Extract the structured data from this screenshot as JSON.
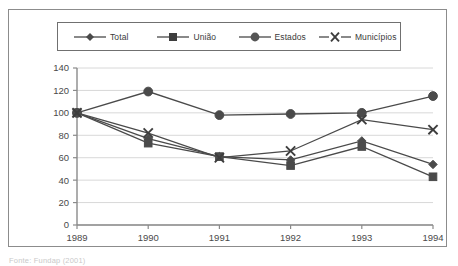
{
  "figure": {
    "caption": "Fonte: Fundap (2001)"
  },
  "legend": {
    "position": "top",
    "items": [
      {
        "label": "Total",
        "marker": "diamond-marker"
      },
      {
        "label": "União",
        "marker": "square-marker"
      },
      {
        "label": "Estados",
        "marker": "circle-marker"
      },
      {
        "label": "Municípios",
        "marker": "x-marker"
      }
    ]
  },
  "chart_data": {
    "type": "line",
    "title": "",
    "subtitle": "",
    "xlabel": "",
    "ylabel": "",
    "categories": [
      "1989",
      "1990",
      "1991",
      "1992",
      "1993",
      "1994"
    ],
    "x": [
      1989,
      1990,
      1991,
      1992,
      1993,
      1994
    ],
    "ylim": [
      0,
      140
    ],
    "yticks": [
      0,
      20,
      40,
      60,
      80,
      100,
      120,
      140
    ],
    "ytick_labels": [
      "0",
      "20",
      "40",
      "60",
      "80",
      "100",
      "120",
      "140"
    ],
    "grid": true,
    "grid_axis": "y",
    "legend_position": "top",
    "series": [
      {
        "name": "Total",
        "marker": "diamond",
        "values": [
          100,
          77,
          61,
          58,
          75,
          54
        ]
      },
      {
        "name": "União",
        "marker": "square",
        "values": [
          100,
          73,
          61,
          53,
          70,
          43
        ]
      },
      {
        "name": "Estados",
        "marker": "circle",
        "values": [
          100,
          119,
          98,
          99,
          100,
          115
        ]
      },
      {
        "name": "Municípios",
        "marker": "x",
        "values": [
          100,
          82,
          60,
          66,
          94,
          85
        ]
      }
    ]
  },
  "colors": {
    "series": "#4a4a4a",
    "grid": "#d8d8d8",
    "axis": "#8a8a8a",
    "frame": "#8c8c8c",
    "text": "#4a4a4a"
  }
}
